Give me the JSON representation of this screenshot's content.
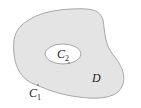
{
  "diagram": {
    "type": "region-with-hole",
    "colors": {
      "region_fill": "#e4e4e4",
      "boundary_stroke": "#a8a8a8",
      "hole_fill": "#ffffff",
      "label": "#222222"
    },
    "labels": {
      "outer_curve": {
        "main": "C",
        "sub": "1"
      },
      "inner_curve": {
        "main": "C",
        "sub": "2"
      },
      "region": "D"
    }
  }
}
